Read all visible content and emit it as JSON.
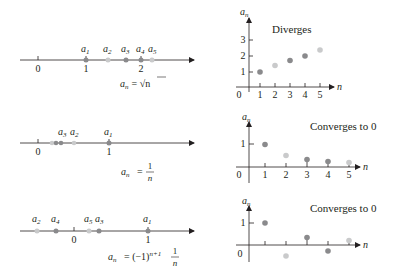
{
  "colors": {
    "axis": "#231f20",
    "point_dark": "#8a8a8c",
    "point_light": "#c9cacb",
    "stem": "#6e6e70"
  },
  "panels": [
    {
      "id": "sqrt-n",
      "formula_lhs": "a",
      "formula_sub": "n",
      "formula_rhs": "= √n",
      "label": "Diverges",
      "number_line": {
        "ticks": [
          {
            "label": "0",
            "value": 0
          },
          {
            "label": "1",
            "value": 1
          },
          {
            "label": "2",
            "value": 2
          }
        ],
        "points": [
          {
            "name": "a",
            "sub": "1",
            "value": 1.0
          },
          {
            "name": "a",
            "sub": "2",
            "value": 1.414
          },
          {
            "name": "a",
            "sub": "3",
            "value": 1.732
          },
          {
            "name": "a",
            "sub": "4",
            "value": 2.0
          },
          {
            "name": "a",
            "sub": "5",
            "value": 2.236
          }
        ]
      },
      "graph": {
        "y_label": "a",
        "y_label_sub": "n",
        "x_label": "n",
        "origin_label": "0",
        "x_ticks": [
          "1",
          "2",
          "3",
          "4",
          "5"
        ],
        "y_ticks": [
          "1",
          "2",
          "3"
        ]
      }
    },
    {
      "id": "one-over-n",
      "formula_lhs": "a",
      "formula_sub": "n",
      "formula_eq": "=",
      "formula_num": "1",
      "formula_den": "n",
      "label": "Converges to 0",
      "number_line": {
        "ticks": [
          {
            "label": "0",
            "value": 0
          },
          {
            "label": "1",
            "value": 1
          }
        ],
        "points": [
          {
            "name": "a",
            "sub": "1",
            "value": 1.0
          },
          {
            "name": "a",
            "sub": "2",
            "value": 0.5
          },
          {
            "name": "a",
            "sub": "3",
            "value": 0.333
          },
          {
            "name": "a",
            "sub": "4",
            "value": 0.25
          },
          {
            "name": "a",
            "sub": "5",
            "value": 0.2
          }
        ],
        "labeled_points": [
          "a3",
          "a2",
          "a1"
        ]
      },
      "graph": {
        "y_label": "a",
        "y_label_sub": "n",
        "x_label": "n",
        "origin_label": "0",
        "x_ticks": [
          "1",
          "2",
          "3",
          "4",
          "5"
        ],
        "y_ticks": [
          "1"
        ]
      }
    },
    {
      "id": "alternating",
      "formula_lhs": "a",
      "formula_sub": "n",
      "formula_eq": "= (−1)",
      "formula_sup": "n+1",
      "formula_num": "1",
      "formula_den": "n",
      "label": "Converges to 0",
      "number_line": {
        "ticks": [
          {
            "label": "0",
            "value": 0
          },
          {
            "label": "1",
            "value": 1
          }
        ],
        "points": [
          {
            "name": "a",
            "sub": "1",
            "value": 1.0
          },
          {
            "name": "a",
            "sub": "2",
            "value": -0.5
          },
          {
            "name": "a",
            "sub": "3",
            "value": 0.333
          },
          {
            "name": "a",
            "sub": "4",
            "value": -0.25
          },
          {
            "name": "a",
            "sub": "5",
            "value": 0.2
          }
        ]
      },
      "graph": {
        "y_label": "a",
        "y_label_sub": "n",
        "x_label": "n",
        "origin_label": "0",
        "x_ticks": [],
        "y_ticks": [
          "1"
        ]
      }
    }
  ]
}
